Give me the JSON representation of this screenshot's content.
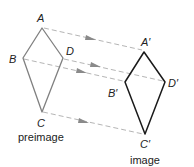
{
  "diagram": {
    "type": "translation",
    "colors": {
      "preimage_stroke": "#808080",
      "image_stroke": "#1a1a1a",
      "arrow": "#b5b5b5",
      "arrowhead": "#8a8a8a",
      "text": "#222222"
    },
    "preimage": {
      "caption": "preimage",
      "labels": {
        "A": "A",
        "B": "B",
        "C": "C",
        "D": "D"
      }
    },
    "image": {
      "caption": "image",
      "labels": {
        "A": "A′",
        "B": "B′",
        "C": "C′",
        "D": "D′"
      }
    }
  }
}
